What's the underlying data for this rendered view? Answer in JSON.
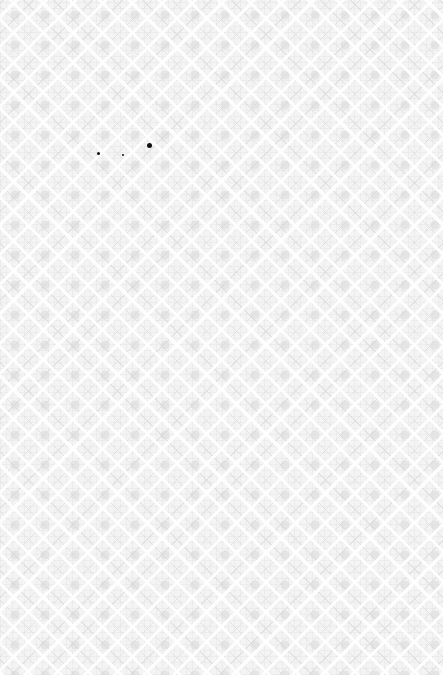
{
  "image": {
    "description": "Light gray decorative damask/lattice patterned paper texture",
    "colors": {
      "base": "#f4f4f4",
      "pattern": "#d9d9d9",
      "highlight": "#ffffff",
      "specks": "#111111"
    },
    "specks": [
      {
        "x": 97,
        "y": 152,
        "size": 3
      },
      {
        "x": 122,
        "y": 154,
        "size": 2
      },
      {
        "x": 147,
        "y": 143,
        "size": 5
      }
    ]
  }
}
